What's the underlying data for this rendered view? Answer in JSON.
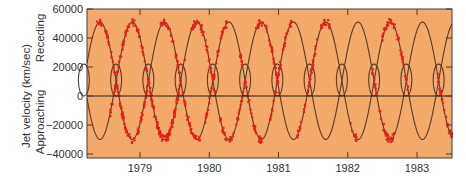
{
  "chart_data": {
    "type": "scatter",
    "title": "",
    "xlabel": "",
    "ylabel": "Jet velocity (km/sec)",
    "ylabel_upper": "Receding",
    "ylabel_lower": "Approaching",
    "ylim": [
      -45000,
      60000
    ],
    "xlim": [
      1978.33,
      1983.55
    ],
    "yticks": [
      60000,
      40000,
      20000,
      0,
      -20000,
      -40000
    ],
    "ytick_labels": [
      "60000",
      "40000",
      "20000",
      "0",
      "−20000",
      "−40000"
    ],
    "xticks": [
      1979,
      1980,
      1981,
      1982,
      1983
    ],
    "xtick_labels": [
      "1979",
      "1980",
      "1981",
      "1982",
      "1983"
    ],
    "grid": false,
    "legend": null,
    "zero_line": true,
    "model_curves": {
      "description": "Two mirror-image kinematic model curves (receding and approaching jets)",
      "period_years": 0.45,
      "phase_year": 1978.45,
      "mean_velocity": 11000,
      "amplitude": 40000,
      "nodding_amplitude": 6000,
      "nodding_period_years": 0.0175
    },
    "series": [
      {
        "name": "model-receding-jet",
        "kind": "line"
      },
      {
        "name": "model-approaching-jet",
        "kind": "line"
      },
      {
        "name": "observed-velocities",
        "kind": "scatter",
        "approx_count": 500
      }
    ]
  },
  "colors": {
    "plot_bg": "#f2a96a",
    "curve": "#5b3b2b",
    "points": "#e3211b",
    "axis": "#4a3a30",
    "text": "#333333"
  }
}
